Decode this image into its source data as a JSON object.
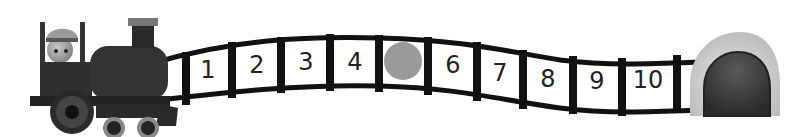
{
  "track": {
    "slots": [
      {
        "label": "1",
        "x": 208,
        "y": 76
      },
      {
        "label": "2",
        "x": 257,
        "y": 72
      },
      {
        "label": "3",
        "x": 306,
        "y": 70
      },
      {
        "label": "4",
        "x": 355,
        "y": 70
      },
      {
        "label": "",
        "x": 404,
        "y": 70,
        "missing": true
      },
      {
        "label": "6",
        "x": 453,
        "y": 70
      },
      {
        "label": "7",
        "x": 500,
        "y": 76
      },
      {
        "label": "8",
        "x": 547,
        "y": 82
      },
      {
        "label": "9",
        "x": 596,
        "y": 86
      },
      {
        "label": "10",
        "x": 645,
        "y": 86
      }
    ],
    "missing_marker_color": "#9a9a9a"
  },
  "colors": {
    "train": "#2e2e2e",
    "track": "#111111",
    "tunnel_outer": "#c8c8c8",
    "tunnel_inner": "#3a3a3a"
  }
}
